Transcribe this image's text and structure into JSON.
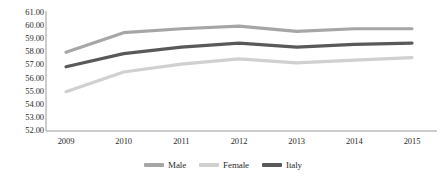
{
  "chart_data": {
    "type": "line",
    "title": "",
    "xlabel": "",
    "ylabel": "",
    "categories": [
      "2009",
      "2010",
      "2011",
      "2012",
      "2013",
      "2014",
      "2015"
    ],
    "ylim": [
      52.0,
      61.0
    ],
    "ytick_step": 1.0,
    "ytick_labels": [
      "61.00",
      "60.00",
      "59.00",
      "58.00",
      "57.00",
      "56.00",
      "55.00",
      "54.00",
      "53.00",
      "52.00"
    ],
    "ytick_values": [
      61.0,
      60.0,
      59.0,
      58.0,
      57.0,
      56.0,
      55.0,
      54.0,
      53.0,
      52.0
    ],
    "grid": false,
    "legend_position": "bottom",
    "series": [
      {
        "name": "Male",
        "color": "#A6A6A6",
        "values": [
          58.0,
          59.5,
          59.8,
          60.0,
          59.6,
          59.8,
          59.8
        ]
      },
      {
        "name": "Female",
        "color": "#D0D0D0",
        "values": [
          55.0,
          56.5,
          57.1,
          57.5,
          57.2,
          57.4,
          57.6
        ]
      },
      {
        "name": "Italy",
        "color": "#595959",
        "values": [
          56.9,
          57.9,
          58.4,
          58.7,
          58.4,
          58.6,
          58.7
        ]
      }
    ]
  },
  "axes": {
    "axis_color": "#9a9a9a",
    "text_color": "#2b2b2b"
  }
}
